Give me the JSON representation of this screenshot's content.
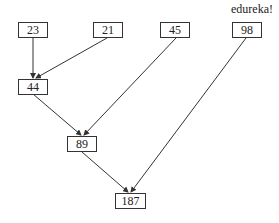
{
  "diagram": {
    "type": "binary-merge-tree",
    "watermark": "edureka!",
    "nodes": {
      "n23": "23",
      "n21": "21",
      "n45": "45",
      "n98": "98",
      "n44": "44",
      "n89": "89",
      "n187": "187"
    },
    "edges": [
      {
        "from": "23",
        "to": "44"
      },
      {
        "from": "21",
        "to": "44"
      },
      {
        "from": "44",
        "to": "89"
      },
      {
        "from": "45",
        "to": "89"
      },
      {
        "from": "89",
        "to": "187"
      },
      {
        "from": "98",
        "to": "187"
      }
    ],
    "colors": {
      "line": "#333333",
      "box_border": "#333333",
      "text": "#222222",
      "background": "#ffffff"
    }
  }
}
